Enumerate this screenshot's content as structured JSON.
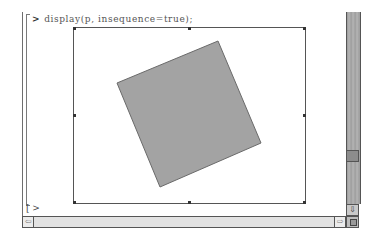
{
  "worksheet": {
    "input_prompt": ">",
    "command": "display(p, insequence=true);",
    "next_prompt": "[ >"
  },
  "plot": {
    "frame": {
      "x": 73,
      "y": 27,
      "width": 231,
      "height": 175
    },
    "shape": {
      "type": "rotated-square",
      "points": "218,41 261,143 160,187 117,83",
      "fill": "#a3a3a3",
      "stroke": "#6a6a6a"
    }
  },
  "scrollbars": {
    "vertical": {
      "down_arrow": "⇩"
    },
    "horizontal": {
      "left_arrow": "⇦",
      "right_arrow": "⇨"
    }
  }
}
